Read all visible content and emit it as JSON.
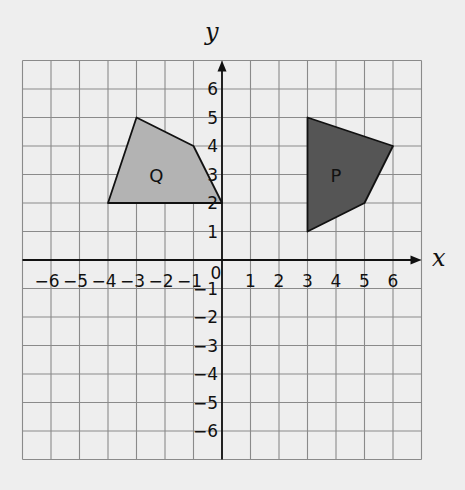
{
  "diagram": {
    "type": "coordinate-grid",
    "axes": {
      "x_label": "x",
      "y_label": "y",
      "x_range": [
        -7,
        7
      ],
      "y_range": [
        -7,
        7
      ],
      "x_ticks": [
        -6,
        -5,
        -4,
        -3,
        -2,
        -1,
        0,
        1,
        2,
        3,
        4,
        5,
        6
      ],
      "y_ticks": [
        -6,
        -5,
        -4,
        -3,
        -2,
        -1,
        1,
        2,
        3,
        4,
        5,
        6
      ],
      "origin_label": "0"
    },
    "shapes": [
      {
        "name": "Q",
        "label": "Q",
        "fill": "#b3b3b3",
        "vertices": [
          [
            -3,
            5
          ],
          [
            -1,
            4
          ],
          [
            0,
            2
          ],
          [
            -4,
            2
          ]
        ],
        "label_pos": [
          -2.3,
          3
        ]
      },
      {
        "name": "P",
        "label": "P",
        "fill": "#555555",
        "vertices": [
          [
            3,
            5
          ],
          [
            6,
            4
          ],
          [
            5,
            2
          ],
          [
            3,
            1
          ]
        ],
        "label_pos": [
          4,
          3
        ]
      }
    ],
    "colors": {
      "background": "#eeeeee",
      "grid": "#8a8a8a",
      "axis": "#111111"
    }
  }
}
